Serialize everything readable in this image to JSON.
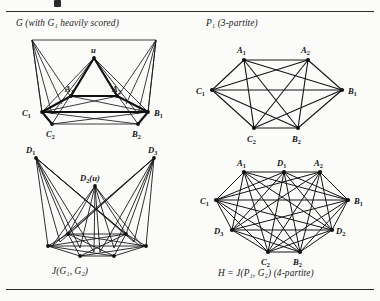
{
  "page": {
    "title_rules": {
      "top": true,
      "bottom": true
    },
    "background": "#fdfdfc",
    "ink": "#141414"
  },
  "captions": {
    "top_left": "G (with G₁ heavily scored)",
    "top_right": "P₁ (3-partite)",
    "bottom_left": "J(G₁, G₂)",
    "bottom_right": "H = J(P₁, G₂) (4-partite)"
  },
  "figures": [
    {
      "id": "graph-G",
      "caption": "G (with G₁ heavily scored)",
      "position": "top-left",
      "vertices": [
        "u",
        "A₁",
        "A₂",
        "C₁",
        "B₁",
        "C₂",
        "B₂"
      ],
      "highlighted_subgraph": "G₁",
      "note": "G₁ drawn with heavy (thick) edges"
    },
    {
      "id": "graph-P1",
      "caption": "P₁ (3-partite)",
      "position": "top-right",
      "vertices": [
        "A₁",
        "A₂",
        "C₁",
        "B₁",
        "C₂",
        "B₂"
      ],
      "partite": 3,
      "parts": [
        [
          "A₁",
          "A₂"
        ],
        [
          "B₁",
          "B₂"
        ],
        [
          "C₁",
          "C₂"
        ]
      ]
    },
    {
      "id": "graph-JG1G2",
      "caption": "J(G₁, G₂)",
      "position": "bottom-left",
      "vertices": [
        "D₁",
        "D₂(u)",
        "D₃",
        "C₁",
        "B₁",
        "C₂",
        "B₂"
      ],
      "labels_visible": [
        "D₁",
        "D₂(u)",
        "D₃"
      ]
    },
    {
      "id": "graph-H",
      "caption": "H = J(P₁, G₂) (4-partite)",
      "position": "bottom-right",
      "vertices": [
        "A₁",
        "D₁",
        "A₂",
        "C₁",
        "B₁",
        "D₃",
        "D₂",
        "C₂",
        "B₂"
      ],
      "partite": 4,
      "parts": [
        [
          "A₁",
          "A₂"
        ],
        [
          "B₁",
          "B₂"
        ],
        [
          "C₁",
          "C₂"
        ],
        [
          "D₁",
          "D₂",
          "D₃"
        ]
      ]
    }
  ],
  "vertex_labels": {
    "u": "u",
    "A1": "A",
    "A1s": "1",
    "A2": "A",
    "A2s": "2",
    "B1": "B",
    "B1s": "1",
    "B2": "B",
    "B2s": "2",
    "C1": "C",
    "C1s": "1",
    "C2": "C",
    "C2s": "2",
    "D1": "D",
    "D1s": "1",
    "D2": "D",
    "D2s": "2",
    "D3": "D",
    "D3s": "3",
    "D2u": "(u)"
  }
}
